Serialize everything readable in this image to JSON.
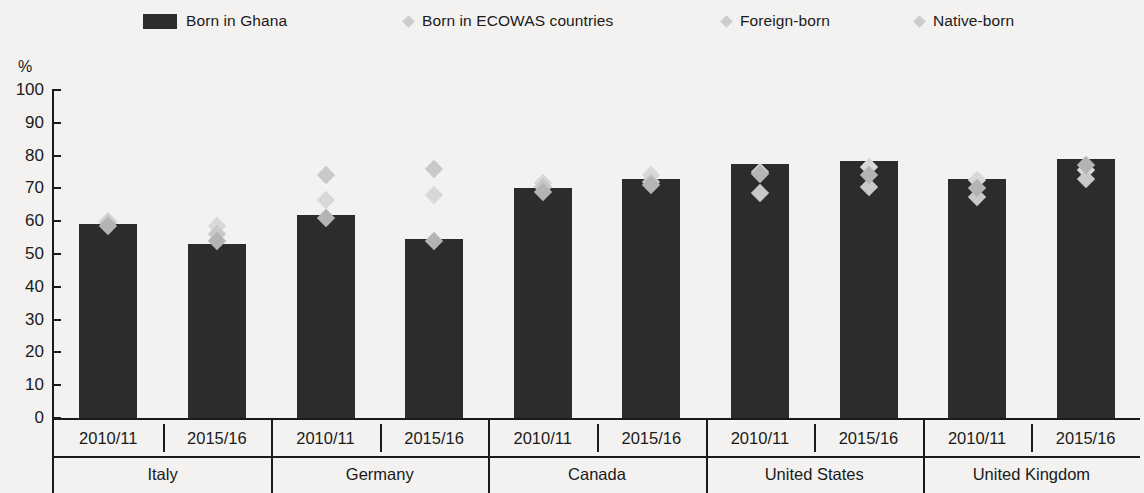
{
  "chart_data": {
    "type": "bar",
    "title": "",
    "subtitle": "",
    "xlabel": "",
    "ylabel": "%",
    "ylim": [
      0,
      100
    ],
    "ytick_step": 10,
    "yticks": [
      "100",
      "90",
      "80",
      "70",
      "60",
      "50",
      "40",
      "30",
      "20",
      "10",
      "0"
    ],
    "grid": false,
    "legend_position": "top",
    "categories": [
      "Italy 2010/11",
      "Italy 2015/16",
      "Germany 2010/11",
      "Germany 2015/16",
      "Canada 2010/11",
      "Canada 2015/16",
      "United States 2010/11",
      "United States 2015/16",
      "United Kingdom 2010/11",
      "United Kingdom 2015/16"
    ],
    "countries": [
      "Italy",
      "Germany",
      "Canada",
      "United States",
      "United Kingdom"
    ],
    "periods": [
      "2010/11",
      "2015/16"
    ],
    "series": [
      {
        "name": "Born in Ghana",
        "type": "bar",
        "color": "#2c2c2c",
        "values": [
          59,
          53,
          62,
          54.5,
          70,
          73,
          77.5,
          78.5,
          73,
          79
        ]
      },
      {
        "name": "Born in ECOWAS countries",
        "type": "marker",
        "color": "#d8d8d8",
        "values": [
          60,
          58.5,
          66.5,
          68,
          71.5,
          74,
          75,
          76.5,
          72.5,
          75.5
        ]
      },
      {
        "name": "Foreign-born",
        "type": "marker",
        "color": "#c9c9c9",
        "values": [
          59.5,
          56,
          74,
          76,
          70.5,
          72,
          68.5,
          70.5,
          67.5,
          73
        ]
      },
      {
        "name": "Native-born",
        "type": "marker",
        "color": "#b4b4b4",
        "values": [
          58.5,
          54,
          61,
          54,
          69,
          71,
          74.5,
          74,
          70,
          77
        ]
      }
    ]
  },
  "legend": {
    "items": [
      {
        "label": "Born in Ghana",
        "marker": "bar-swatch",
        "color": "#2c2c2c",
        "x": 143
      },
      {
        "label": "Born in ECOWAS countries",
        "marker": "diamond-marker",
        "color": "#cdcdcd",
        "x": 404
      },
      {
        "label": "Foreign-born",
        "marker": "diamond-marker",
        "color": "#cdcdcd",
        "x": 722
      },
      {
        "label": "Native-born",
        "marker": "diamond-marker",
        "color": "#cdcdcd",
        "x": 915
      }
    ]
  },
  "axis": {
    "unit_label": "%"
  }
}
